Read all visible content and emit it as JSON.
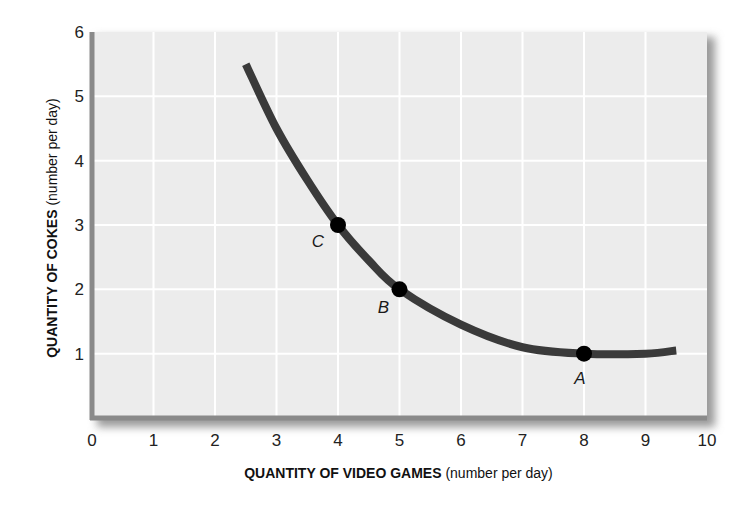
{
  "chart_data": {
    "type": "line",
    "title": "",
    "xlabel": "QUANTITY OF VIDEO GAMES",
    "xlabel_unit": "(number per day)",
    "ylabel": "QUANTITY OF COKES",
    "ylabel_unit": "(number per day)",
    "xlim": [
      0,
      10
    ],
    "ylim": [
      0,
      6
    ],
    "x_ticks": [
      "0",
      "1",
      "2",
      "3",
      "4",
      "5",
      "6",
      "7",
      "8",
      "9",
      "10"
    ],
    "y_ticks": [
      "1",
      "2",
      "3",
      "4",
      "5",
      "6"
    ],
    "grid": true,
    "legend": null,
    "series": [
      {
        "name": "indifference curve",
        "x": [
          2.5,
          3,
          3.5,
          4,
          4.5,
          5,
          6,
          7,
          8,
          9,
          9.5
        ],
        "y": [
          5.5,
          4.5,
          3.7,
          3,
          2.45,
          2,
          1.45,
          1.1,
          1,
          1,
          1.05
        ]
      }
    ],
    "annotations": [
      {
        "label": "A",
        "x": 8,
        "y": 1
      },
      {
        "label": "B",
        "x": 5,
        "y": 2
      },
      {
        "label": "C",
        "x": 4,
        "y": 3
      }
    ],
    "colors": {
      "plot_background": "#ececec",
      "grid": "#ffffff",
      "curve": "#3a3a3a",
      "points": "#000000",
      "axis": "#8a8a8a"
    }
  }
}
